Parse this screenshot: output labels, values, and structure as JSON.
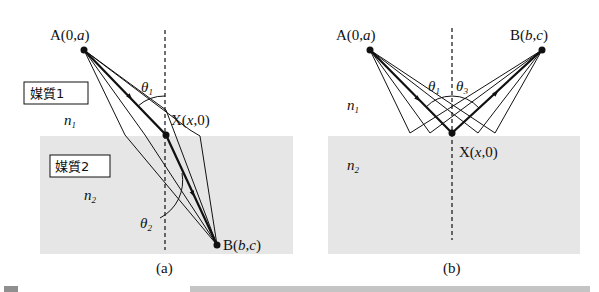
{
  "figure_a": {
    "label": "(a)",
    "point_A": {
      "name": "A",
      "coords": "(0,a)"
    },
    "point_X": {
      "name": "X",
      "coords": "(x,0)"
    },
    "point_B": {
      "name": "B",
      "coords": "(b,c)"
    },
    "medium1_box": "媒質1",
    "medium2_box": "媒質2",
    "n1": "n",
    "n1_sub": "1",
    "n2": "n",
    "n2_sub": "2",
    "theta1": "θ",
    "theta1_sub": "1",
    "theta2": "θ",
    "theta2_sub": "2"
  },
  "figure_b": {
    "label": "(b)",
    "point_A": {
      "name": "A",
      "coords": "(0,a)"
    },
    "point_B": {
      "name": "B",
      "coords": "(b,c)"
    },
    "point_X": {
      "name": "X",
      "coords": "(x,0)"
    },
    "n1": "n",
    "n1_sub": "1",
    "n2": "n",
    "n2_sub": "2",
    "theta1": "θ",
    "theta1_sub": "1",
    "theta3": "θ",
    "theta3_sub": "3"
  },
  "colors": {
    "medium2_fill": "#e6e6e6",
    "ink": "#111111"
  }
}
